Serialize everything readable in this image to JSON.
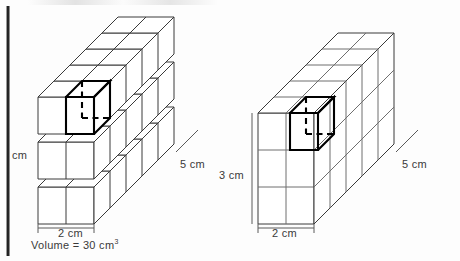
{
  "figure": {
    "background_color": "#fdfdfd",
    "line_color": "#333333",
    "highlight_color": "#000000"
  },
  "left_figure": {
    "name": "exploded-layers-prism",
    "description": "2 by 3 by 5 stack of unit cubes shown as three separated horizontal layers",
    "dimensions": {
      "width_cubes": 2,
      "height_cubes": 3,
      "depth_cubes": 5
    },
    "labels": {
      "height": "cm",
      "width": "2 cm",
      "depth": "5 cm",
      "volume": "Volume = 30 cm",
      "volume_exponent": "3"
    }
  },
  "right_figure": {
    "name": "solid-prism",
    "description": "Solid 2 by 3 by 5 rectangular prism with unit cube grid lines",
    "dimensions": {
      "width_cubes": 2,
      "height_cubes": 3,
      "depth_cubes": 5
    },
    "labels": {
      "height": "3 cm",
      "width": "2 cm",
      "depth": "5 cm"
    }
  },
  "highlighted_cube": {
    "label": "unit cube",
    "style": "bold outline with dashed hidden edges"
  }
}
